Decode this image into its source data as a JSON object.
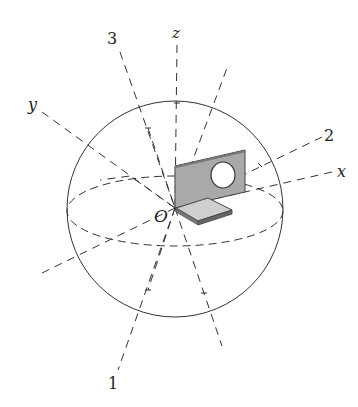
{
  "diagram": {
    "type": "sphere-principal-axes",
    "labels": {
      "origin": "O",
      "axis_x": "x",
      "axis_y": "y",
      "axis_z": "z",
      "principal_1": "1",
      "principal_2": "2",
      "principal_3": "3"
    },
    "colors": {
      "line": "#333333",
      "bracket_face": "#a9a9a9",
      "bracket_top": "#c4c4c4",
      "bracket_edge": "#444444",
      "background": "#ffffff"
    }
  }
}
